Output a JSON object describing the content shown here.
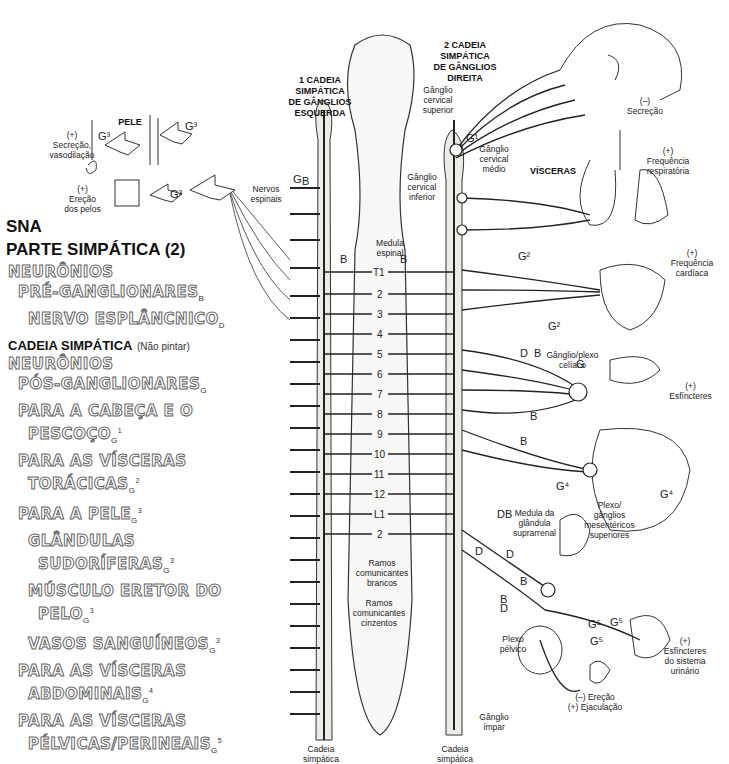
{
  "legend": {
    "title_line1": "SNA",
    "title_line2": "PARTE SIMPÁTICA (2)",
    "preganglionic": {
      "line1": "NEURÔNIOS",
      "line2": "PRÉ-GANGLIONARES",
      "line2_sub": "B",
      "line3": "NERVO ESPLÂNCNICO",
      "line3_sub": "D"
    },
    "chain_heading": "CADEIA SIMPÁTICA",
    "chain_note": "(Não pintar)",
    "postganglionic": {
      "line1": "NEURÔNIOS",
      "line2": "PÓS-GANGLIONARES",
      "line2_sub": "G",
      "items": [
        {
          "text": "PARA A CABEÇA E O",
          "indent": 1
        },
        {
          "text": "PESCOÇO",
          "sub": "G",
          "sup": "1",
          "indent": 2
        },
        {
          "text": "PARA AS VÍSCERAS",
          "indent": 1
        },
        {
          "text": "TORÁCICAS",
          "sub": "G",
          "sup": "2",
          "indent": 2
        },
        {
          "text": "PARA A PELE",
          "sub": "G",
          "sup": "3",
          "indent": 1
        },
        {
          "text": "GLÂNDULAS",
          "indent": 2
        },
        {
          "text": "SUDORÍFERAS",
          "sub": "G",
          "sup": "3",
          "indent": 3
        },
        {
          "text": "MÚSCULO ERETOR DO",
          "indent": 2
        },
        {
          "text": "PELO",
          "sub": "G",
          "sup": "3",
          "indent": 3
        },
        {
          "text": "VASOS SANGUÍNEOS",
          "sub": "G",
          "sup": "3",
          "indent": 2
        },
        {
          "text": "PARA AS VÍSCERAS",
          "indent": 1
        },
        {
          "text": "ABDOMINAIS",
          "sub": "G",
          "sup": "4",
          "indent": 2
        },
        {
          "text": "PARA AS VÍSCERAS",
          "indent": 1
        },
        {
          "text": "PÉLVICAS/PERINEAIS",
          "sub": "G",
          "sup": "5",
          "indent": 2
        }
      ]
    }
  },
  "skin": {
    "title": "PELE",
    "effect1_sign": "(+)",
    "effect1_text1": "Secreção,",
    "effect1_text2": "vasodilação",
    "effect2_sign": "(+)",
    "effect2_text1": "Ereção",
    "effect2_text2": "dos pelos",
    "g_label": "G³"
  },
  "chains": {
    "left_title": [
      "1 CADEIA",
      "SIMPÁTICA",
      "DE GÂNGLIOS",
      "ESQUERDA"
    ],
    "right_title": [
      "2 CADEIA",
      "SIMPÁTICA",
      "DE GÂNGLIOS",
      "DIREITA"
    ],
    "left_bottom": [
      "Cadeia",
      "simpática"
    ],
    "right_bottom": [
      "Cadeia",
      "simpática"
    ]
  },
  "labels": {
    "nervos_espinais": [
      "Nervos",
      "espinais"
    ],
    "medula_espinal": [
      "Medula",
      "espinal"
    ],
    "ganglio_cervical_superior": [
      "Gânglio",
      "cervical",
      "superior"
    ],
    "ganglio_cervical_medio": [
      "Gânglio",
      "cervical",
      "médio"
    ],
    "ganglio_cervical_inferior": [
      "Gânglio",
      "cervical",
      "inferior"
    ],
    "visceras": "VÍSCERAS",
    "ganglio_plexo_celiaco": [
      "Gânglio/plexo",
      "celíaco"
    ],
    "medula_suprarrenal": [
      "Medula da",
      "glândula",
      "suprarrenal"
    ],
    "plexo_mesentericos": [
      "Plexo/",
      "gânglios",
      "mesentéricos",
      "superiores"
    ],
    "ramos_brancos": [
      "Ramos",
      "comunicantes",
      "brancos"
    ],
    "ramos_cinzentos": [
      "Ramos",
      "comunicantes",
      "cinzentos"
    ],
    "plexo_pelvico": [
      "Plexo",
      "pélvico"
    ],
    "ganglio_impar": [
      "Gânglio",
      "ímpar"
    ]
  },
  "effects": {
    "head": {
      "sign": "(–)",
      "text": "Secreção"
    },
    "lungs": {
      "sign": "(+)",
      "text": [
        "Frequência",
        "respiratória"
      ]
    },
    "heart": {
      "sign": "(+)",
      "text": [
        "Frequência",
        "cardíaca"
      ]
    },
    "gut": {
      "sign": "(+)",
      "text": "Esfíncteres"
    },
    "bladder": {
      "sign": "(+)",
      "text": [
        "Esfíncteres",
        "do sistema",
        "urinário"
      ]
    },
    "genital": {
      "line1": "(–) Ereção",
      "line2": "(+) Ejaculação"
    }
  },
  "segments": [
    "T1",
    "2",
    "3",
    "4",
    "5",
    "6",
    "7",
    "8",
    "9",
    "10",
    "11",
    "12",
    "L1",
    "2"
  ],
  "letters": {
    "B": "B",
    "D": "D",
    "G": "G",
    "G1": "G¹",
    "G2": "G²",
    "G4": "G⁴",
    "G5": "G⁵"
  }
}
